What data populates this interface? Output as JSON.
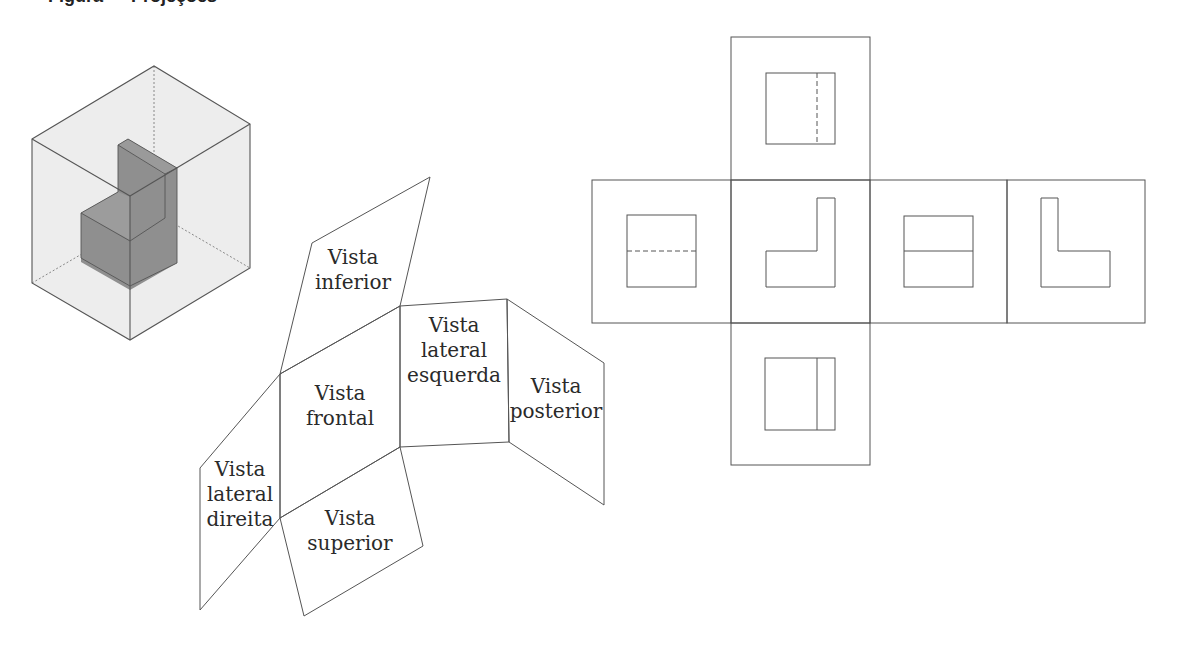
{
  "caption": {
    "text": "Figura — Projeções"
  },
  "isometric_view": {
    "box_fill": "#ececec",
    "solid_fill": "#8f8f8f",
    "edge_color": "#555555"
  },
  "unfolded_panels": [
    {
      "id": "inferior",
      "lines": [
        "Vista",
        "inferior"
      ]
    },
    {
      "id": "lateral-esquerda",
      "lines": [
        "Vista",
        "lateral",
        "esquerda"
      ]
    },
    {
      "id": "posterior",
      "lines": [
        "Vista",
        "posterior"
      ]
    },
    {
      "id": "frontal",
      "lines": [
        "Vista",
        "frontal"
      ]
    },
    {
      "id": "lateral-direita",
      "lines": [
        "Vista",
        "lateral",
        "direita"
      ]
    },
    {
      "id": "superior",
      "lines": [
        "Vista",
        "superior"
      ]
    }
  ],
  "orthographic_layout": {
    "arrangement": "cross",
    "cells": [
      "top",
      "left",
      "center",
      "right-1",
      "right-2",
      "bottom"
    ],
    "line_color": "#555555"
  }
}
